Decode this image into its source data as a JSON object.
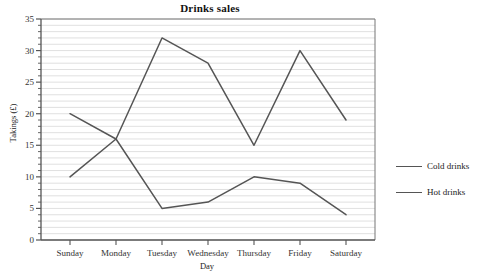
{
  "chart_data": {
    "type": "line",
    "title": "Drinks sales",
    "xlabel": "Day",
    "ylabel": "Takings (£)",
    "categories": [
      "Sunday",
      "Monday",
      "Tuesday",
      "Wednesday",
      "Thursday",
      "Friday",
      "Saturday"
    ],
    "series": [
      {
        "name": "Cold drinks",
        "values": [
          10,
          16,
          5,
          6,
          10,
          9,
          4
        ],
        "color": "#555555"
      },
      {
        "name": "Hot drinks",
        "values": [
          20,
          16,
          32,
          28,
          15,
          30,
          19
        ],
        "color": "#555555"
      }
    ],
    "ylim": [
      0,
      35
    ],
    "yticks": [
      0,
      5,
      10,
      15,
      20,
      25,
      30,
      35
    ],
    "ytick_labels": [
      "0",
      "5",
      "10",
      "15",
      "20",
      "25",
      "30",
      "35"
    ],
    "grid": true,
    "grid_minor_step": 1,
    "legend_position": "right",
    "plot_bg": "#ffffff",
    "grid_color": "#d8d8d8",
    "axis_color": "#555555"
  },
  "legend": {
    "items": [
      {
        "label": "Cold drinks"
      },
      {
        "label": "Hot drinks"
      }
    ]
  }
}
